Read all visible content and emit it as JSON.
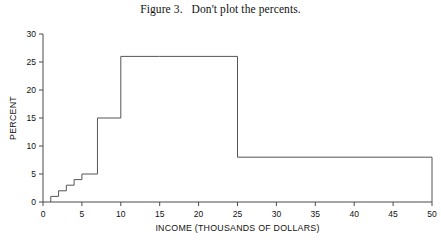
{
  "figure": {
    "title": "Figure 3.   Don't plot the percents."
  },
  "chart_data": {
    "type": "bar",
    "title": "Figure 3.   Don't plot the percents.",
    "xlabel": "INCOME (THOUSANDS OF DOLLARS)",
    "ylabel": "PERCENT",
    "xlim": [
      0,
      50
    ],
    "ylim": [
      0,
      30
    ],
    "xticks": [
      0,
      5,
      10,
      15,
      20,
      25,
      30,
      35,
      40,
      45,
      50
    ],
    "xticklabels": [
      "0",
      "5",
      "10",
      "15",
      "20",
      "25",
      "30",
      "35",
      "40",
      "45",
      "50"
    ],
    "yticks": [
      0,
      5,
      10,
      15,
      20,
      25,
      30
    ],
    "yticklabels": [
      "0",
      "5",
      "10",
      "15",
      "20",
      "25",
      "30"
    ],
    "grid": false,
    "legend": null,
    "style": "unfilled-outline-histogram",
    "bar_color": "#555555",
    "bins": [
      {
        "x0": 1,
        "x1": 2,
        "height": 1
      },
      {
        "x0": 2,
        "x1": 3,
        "height": 2
      },
      {
        "x0": 3,
        "x1": 4,
        "height": 3
      },
      {
        "x0": 4,
        "x1": 5,
        "height": 4
      },
      {
        "x0": 5,
        "x1": 6,
        "height": 5
      },
      {
        "x0": 6,
        "x1": 7,
        "height": 5
      },
      {
        "x0": 7,
        "x1": 10,
        "height": 15
      },
      {
        "x0": 10,
        "x1": 15,
        "height": 26
      },
      {
        "x0": 15,
        "x1": 25,
        "height": 26
      },
      {
        "x0": 25,
        "x1": 50,
        "height": 8
      }
    ]
  }
}
